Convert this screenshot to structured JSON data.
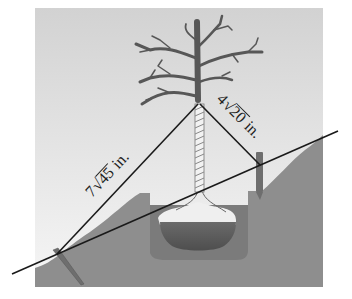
{
  "diagram": {
    "labels": {
      "left_wire": {
        "coefficient": "7",
        "radicand": "45",
        "unit": "in."
      },
      "right_wire": {
        "coefficient": "4",
        "radicand": "20",
        "unit": "in."
      }
    },
    "colors": {
      "sky_top": "#d4d4d4",
      "sky_bottom": "#f4f4f4",
      "ground": "#8c8c8c",
      "hole": "#7a7a7a",
      "root_ball": "#f0f0f0",
      "soil": "#5e5e5e",
      "tree": "#555555",
      "wire": "#1a1a1a"
    }
  }
}
